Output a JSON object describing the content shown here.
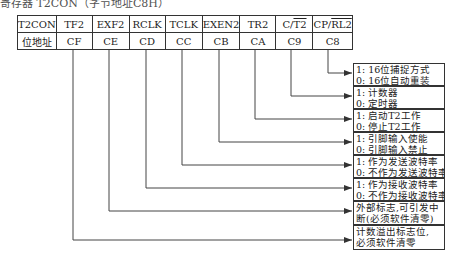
{
  "caption": "寄存器 T2CON（字节地址C8H）",
  "register": {
    "name": "T2CON",
    "row_label": "位地址",
    "bits": [
      {
        "name": "TF2",
        "addr": "CF"
      },
      {
        "name": "EXF2",
        "addr": "CE"
      },
      {
        "name": "RCLK",
        "addr": "CD"
      },
      {
        "name": "TCLK",
        "addr": "CC"
      },
      {
        "name": "EXEN2",
        "addr": "CB"
      },
      {
        "name": "TR2",
        "addr": "CA"
      },
      {
        "name": "C/T2",
        "addr": "C9"
      },
      {
        "name": "CP/RL2",
        "addr": "C8"
      }
    ]
  },
  "descriptions": [
    {
      "bit": "CP/RL2",
      "line1": "1: 16位捕捉方式",
      "line2": "0: 16位自动重装"
    },
    {
      "bit": "C/T2",
      "line1": "1: 计数器",
      "line2": "0: 定时器"
    },
    {
      "bit": "TR2",
      "line1": "1: 启动T2工作",
      "line2": "0: 停止T2工作"
    },
    {
      "bit": "EXEN2",
      "line1": "1: 引脚输入使能",
      "line2": "0: 引脚输入禁止"
    },
    {
      "bit": "TCLK",
      "line1": "1: 作为发送波特率",
      "line2": "0: 不作为发送波特率"
    },
    {
      "bit": "RCLK",
      "line1": "1: 作为接收波特率",
      "line2": "0: 不作为接收波特率"
    },
    {
      "bit": "EXF2",
      "line1": "外部标志,可引发中",
      "line2": "断(必须软件清零)"
    },
    {
      "bit": "TF2",
      "line1": "计数溢出标志位,",
      "line2": "必须软件清零"
    }
  ]
}
